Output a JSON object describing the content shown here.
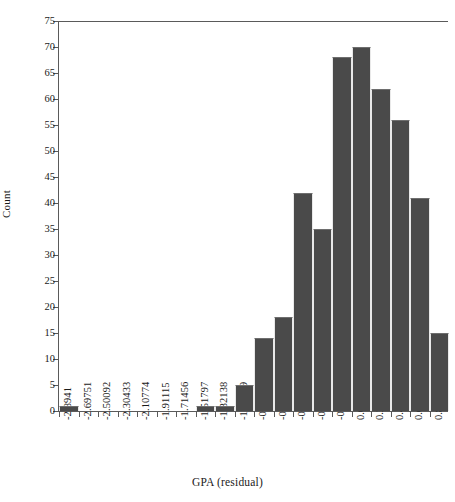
{
  "chart_data": {
    "type": "bar",
    "title": "",
    "xlabel": "GPA (residual)",
    "ylabel": "Count",
    "grid": false,
    "legend": null,
    "ylim": [
      0,
      75
    ],
    "yticks": [
      0,
      5,
      10,
      15,
      20,
      25,
      30,
      35,
      40,
      45,
      50,
      55,
      60,
      65,
      70,
      75
    ],
    "ytick_labels": [
      "0",
      "5",
      "10",
      "15",
      "20",
      "25",
      "30",
      "35",
      "40",
      "45",
      "50",
      "55",
      "60",
      "65",
      "70",
      "75"
    ],
    "bin_edges": [
      "-2.8941",
      "-2.69751",
      "-2.50092",
      "-2.30433",
      "-2.10774",
      "-1.91115",
      "-1.71456",
      "-1.51797",
      "-1.32138",
      "-1.12479",
      "-0.928198",
      "-0.731608",
      "-0.535018",
      "-0.338428",
      "-0.141838",
      "0.0547514",
      "0.251341",
      "0.447931",
      "0.644521",
      "0.841111"
    ],
    "categories": [
      "-2.8941",
      "-2.69751",
      "-2.50092",
      "-2.30433",
      "-2.10774",
      "-1.91115",
      "-1.71456",
      "-1.51797",
      "-1.32138",
      "-1.12479",
      "-0.928198",
      "-0.731608",
      "-0.535018",
      "-0.338428",
      "-0.141838",
      "0.0547514",
      "0.251341",
      "0.447931",
      "0.644521",
      "0.841111"
    ],
    "values": [
      1,
      0,
      0,
      0,
      0,
      0,
      0,
      1,
      1,
      5,
      14,
      18,
      42,
      35,
      68,
      70,
      62,
      56,
      41,
      15
    ],
    "bar_color": "#4a4a4a",
    "axis_color": "#5a5a5a",
    "background": "#ffffff"
  }
}
